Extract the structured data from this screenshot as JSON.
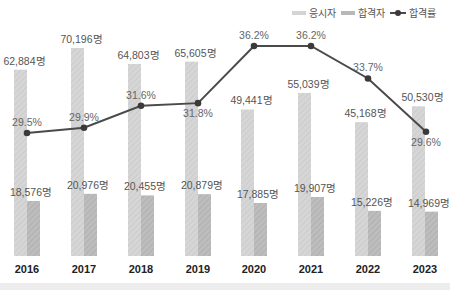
{
  "legend": {
    "applicants_label": "응시자",
    "passed_label": "합격자",
    "rate_label": "합격률"
  },
  "colors": {
    "applicants": "#d4d4d4",
    "passed": "#b8b8b8",
    "line": "#4a4a4a",
    "marker": "#3a3a3a",
    "label_text": "#555555",
    "year_text": "#222222"
  },
  "chart_data": {
    "type": "bar",
    "title": "",
    "xlabel": "",
    "ylabel": "",
    "categories": [
      "2016",
      "2017",
      "2018",
      "2019",
      "2020",
      "2021",
      "2022",
      "2023"
    ],
    "series": [
      {
        "name": "응시자",
        "type": "bar",
        "values": [
          62884,
          70196,
          64803,
          65605,
          49441,
          55039,
          45168,
          50530
        ],
        "labels": [
          "62,884명",
          "70,196명",
          "64,803명",
          "65,605명",
          "49,441명",
          "55,039명",
          "45,168명",
          "50,530명"
        ]
      },
      {
        "name": "합격자",
        "type": "bar",
        "values": [
          18576,
          20976,
          20455,
          20879,
          17885,
          19907,
          15226,
          14969
        ],
        "labels": [
          "18,576명",
          "20,976명",
          "20,455명",
          "20,879명",
          "17,885명",
          "19,907명",
          "15,226명",
          "14,969명"
        ]
      },
      {
        "name": "합격률",
        "type": "line",
        "values": [
          29.5,
          29.9,
          31.6,
          31.8,
          36.2,
          36.2,
          33.7,
          29.6
        ],
        "labels": [
          "29.5%",
          "29.9%",
          "31.6%",
          "31.8%",
          "36.2%",
          "36.2%",
          "33.7%",
          "29.6%"
        ]
      }
    ],
    "grid": false,
    "legend_position": "top-right"
  }
}
